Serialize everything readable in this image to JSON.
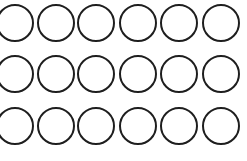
{
  "figure": {
    "rows": 3,
    "columns": 6,
    "stroke_color": "#1e1e1e",
    "fill_color": "#ffffff",
    "circle_centers": {
      "x": [
        15,
        56,
        96,
        138,
        179,
        221
      ],
      "y": [
        23,
        74,
        126
      ]
    },
    "circle_diameter": 38
  }
}
